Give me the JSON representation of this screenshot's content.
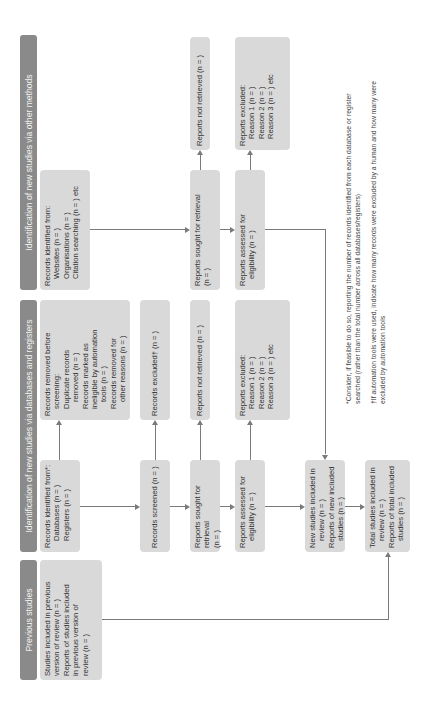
{
  "headers": {
    "previous": "Previous studies",
    "databases": "Identification of new studies via databases and registers",
    "other": "Identification of new studies via other methods"
  },
  "previous": {
    "line1": "Studies included in previous",
    "line2": "version of review (n = )",
    "line3": "Reports of studies included",
    "line4": "in previous version of",
    "line5": "review (n = )"
  },
  "databases": {
    "identified": {
      "title": "Records identified from*:",
      "items": [
        "Databases (n = )",
        "Registers (n = )"
      ]
    },
    "removed": {
      "title": "Records removed before",
      "title2": "screening:",
      "items": [
        "Duplicate records",
        "removed (n = )",
        "Records marked as",
        "ineligible by automation",
        "tools (n = )",
        "Records removed for",
        "other reasons (n = )"
      ]
    },
    "screened": "Records screened (n = )",
    "excluded": "Records excluded† (n = )",
    "sought": {
      "line1": "Reports sought for retrieval",
      "line2": "(n = )"
    },
    "not_retrieved": "Reports not retrieved (n = )",
    "assessed": {
      "line1": "Reports assessed for",
      "line2": "eligibility (n = )"
    },
    "reports_excluded": {
      "title": "Reports excluded:",
      "items": [
        "Reason 1 (n = )",
        "Reason 2 (n = )",
        "Reason 3 (n = ) etc"
      ]
    },
    "new_included": {
      "line1": "New studies included in",
      "line2": "review (n = )",
      "line3": "Reports of new included",
      "line4": "studies (n = )"
    },
    "total_included": {
      "line1": "Total studies included in",
      "line2": "review (n = )",
      "line3": "Reports of total included",
      "line4": "studies (n = )"
    }
  },
  "other": {
    "identified": {
      "title": "Records identified from:",
      "items": [
        "Websites (n = )",
        "Organisations (n = )",
        "Citation searching (n = ) etc"
      ]
    },
    "sought": {
      "line1": "Reports sought for retrieval",
      "line2": "(n = )"
    },
    "not_retrieved": "Reports not retrieved (n = )",
    "assessed": {
      "line1": "Reports assessed for",
      "line2": "eligibility (n = )"
    },
    "reports_excluded": {
      "title": "Reports excluded:",
      "items": [
        "Reason 1 (n = )",
        "Reason 2 (n = )",
        "Reason 3 (n = ) etc"
      ]
    }
  },
  "footnotes": {
    "f1a": "*Consider, if feasible to do so, reporting the number of records identified from each database",
    "f1b": "or register searched (rather than the total number across all databases/registers)",
    "f2a": "†If automation tools were used, indicate how many records were excluded by a human and",
    "f2b": "how many were excluded by automation tools"
  },
  "colors": {
    "header_bg": "#8a8a8a",
    "box_bg": "#d9d9d9",
    "line": "#7a7a7a"
  }
}
